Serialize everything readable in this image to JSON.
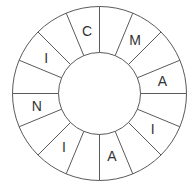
{
  "wheel": {
    "center": [
      99.5,
      93.5
    ],
    "outer_radius": 87,
    "inner_radius": 41,
    "segment_count": 16,
    "line_color": "#5a5a5a",
    "text_color": "#333333",
    "background": "#ffffff",
    "segments": [
      {
        "index": 0,
        "letter": ""
      },
      {
        "index": 1,
        "letter": "M"
      },
      {
        "index": 2,
        "letter": ""
      },
      {
        "index": 3,
        "letter": "A"
      },
      {
        "index": 4,
        "letter": ""
      },
      {
        "index": 5,
        "letter": "I"
      },
      {
        "index": 6,
        "letter": ""
      },
      {
        "index": 7,
        "letter": "A"
      },
      {
        "index": 8,
        "letter": ""
      },
      {
        "index": 9,
        "letter": "I"
      },
      {
        "index": 10,
        "letter": ""
      },
      {
        "index": 11,
        "letter": "N"
      },
      {
        "index": 12,
        "letter": ""
      },
      {
        "index": 13,
        "letter": "I"
      },
      {
        "index": 14,
        "letter": ""
      },
      {
        "index": 15,
        "letter": "C"
      }
    ]
  }
}
